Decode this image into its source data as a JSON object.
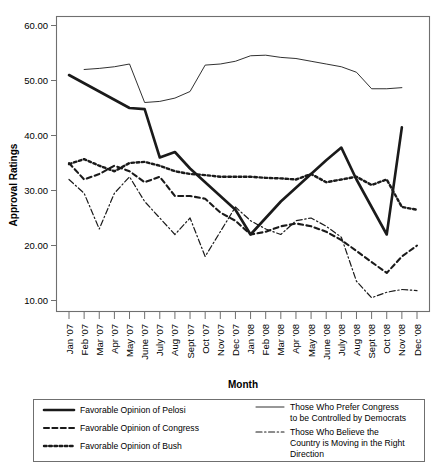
{
  "chart_data": {
    "type": "line",
    "title": "",
    "xlabel": "Month",
    "ylabel": "Approval Ratings",
    "ylim": [
      5,
      64
    ],
    "yticks": [
      10,
      20,
      30,
      40,
      50,
      60
    ],
    "ytick_labels": [
      "10.00",
      "20.00",
      "30.00",
      "40.00",
      "50.00",
      "60.00"
    ],
    "grid": false,
    "legend_position": "bottom",
    "categories": [
      "Jan '07",
      "Feb '07",
      "Mar '07",
      "Apr '07",
      "May '07",
      "June '07",
      "July '07",
      "Aug '07",
      "Sept '07",
      "Oct '07",
      "Nov '07",
      "Dec '07",
      "Jan '08",
      "Feb '08",
      "Mar '08",
      "Apr '08",
      "May '08",
      "June '08",
      "July '08",
      "Aug '08",
      "Sept '08",
      "Oct '08",
      "Nov '08",
      "Dec '08"
    ],
    "series": [
      {
        "name": "Favorable Opinion of Pelosi",
        "style": "solid-thick",
        "values": [
          51.0,
          49.5,
          48.0,
          46.5,
          45.0,
          44.8,
          36.0,
          37.0,
          34.0,
          31.5,
          29.0,
          26.5,
          22.0,
          25.0,
          28.0,
          30.5,
          33.0,
          35.5,
          37.8,
          32.0,
          27.0,
          22.0,
          41.5,
          null
        ]
      },
      {
        "name": "Favorable Opinion of Congress",
        "style": "dashed",
        "values": [
          35.0,
          32.0,
          33.0,
          34.5,
          33.5,
          31.5,
          32.5,
          29.0,
          29.0,
          28.5,
          26.0,
          24.5,
          22.0,
          22.5,
          23.5,
          24.0,
          23.5,
          22.5,
          21.0,
          19.0,
          17.0,
          15.0,
          18.0,
          20.0
        ]
      },
      {
        "name": "Favorable Opinion of Bush",
        "style": "dotted",
        "values": [
          34.8,
          35.7,
          34.5,
          33.5,
          35.0,
          35.2,
          34.5,
          33.5,
          33.0,
          32.8,
          32.5,
          32.5,
          32.5,
          32.3,
          32.2,
          32.0,
          33.0,
          31.5,
          32.0,
          32.5,
          31.0,
          32.0,
          27.0,
          26.5
        ]
      },
      {
        "name": "Those Who Prefer Congress to be Controlled by Democrats",
        "style": "solid-thin",
        "values": [
          null,
          52.0,
          52.2,
          52.5,
          53.0,
          46.0,
          46.2,
          46.8,
          48.0,
          52.8,
          53.0,
          53.5,
          54.5,
          54.6,
          54.2,
          54.0,
          53.5,
          53.0,
          52.5,
          51.5,
          48.5,
          48.5,
          48.7,
          null
        ]
      },
      {
        "name": "Those Who Believe the Country is Moving in the Right Direction",
        "style": "dash-dot",
        "values": [
          32.0,
          29.5,
          23.0,
          29.5,
          32.5,
          28.0,
          25.0,
          22.0,
          25.0,
          18.0,
          22.5,
          27.0,
          24.5,
          23.0,
          22.0,
          24.5,
          25.0,
          23.5,
          21.5,
          13.5,
          10.5,
          11.5,
          12.0,
          11.8
        ]
      }
    ]
  },
  "axes": {
    "y_title": "Approval Ratings",
    "x_title": "Month"
  },
  "legend": {
    "entries": [
      {
        "label": "Favorable Opinion of Pelosi",
        "style": "solid-thick"
      },
      {
        "label": "Favorable Opinion of Congress",
        "style": "dashed"
      },
      {
        "label": "Favorable Opinion of Bush",
        "style": "dotted"
      },
      {
        "label_line1": "Those Who Prefer Congress",
        "label_line2": "to be Controlled by Democrats",
        "style": "solid-thin"
      },
      {
        "label_line1": "Those Who Believe the",
        "label_line2": "Country is Moving in the Right",
        "label_line3": "Direction",
        "style": "dash-dot"
      }
    ]
  },
  "colors": {
    "line": "#1a1a1a",
    "frame": "#6f6f6f",
    "background": "#ffffff"
  }
}
